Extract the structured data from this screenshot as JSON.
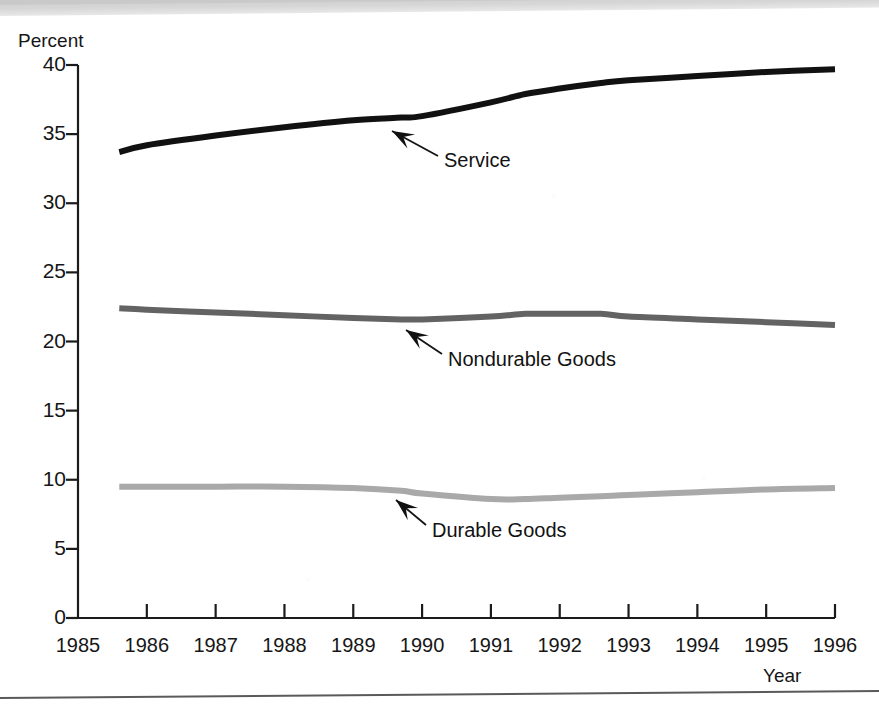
{
  "figure": {
    "kind": "scanned-line-chart",
    "y_axis_title": "Percent",
    "x_axis_title": "Year"
  },
  "chart_data": {
    "type": "line",
    "title": "",
    "subtitle": "",
    "xlabel": "Year",
    "ylabel": "Percent",
    "xlim": [
      1985,
      1996
    ],
    "ylim": [
      0,
      40
    ],
    "grid": false,
    "legend": "inline-annotations",
    "x": [
      1985.6,
      1986,
      1987,
      1988,
      1989,
      1989.7,
      1990,
      1991,
      1991.5,
      1992,
      1992.6,
      1993,
      1994,
      1995,
      1996
    ],
    "xticks": [
      "1985",
      "1986",
      "1987",
      "1988",
      "1989",
      "1990",
      "1991",
      "1992",
      "1993",
      "1994",
      "1995",
      "1996"
    ],
    "yticks": [
      "0",
      "5",
      "10",
      "15",
      "20",
      "25",
      "30",
      "35",
      "40"
    ],
    "series": [
      {
        "name": "Service",
        "color": "#111111",
        "linewidth": 6,
        "values": [
          33.7,
          34.2,
          34.9,
          35.5,
          36.0,
          36.2,
          36.3,
          37.3,
          37.9,
          38.3,
          38.7,
          38.9,
          39.2,
          39.5,
          39.7
        ],
        "annotation": {
          "label": "Service",
          "label_x": 444,
          "label_y": 149,
          "arrow_from_x": 438,
          "arrow_from_y": 156,
          "arrow_to_x": 392,
          "arrow_to_y": 131
        }
      },
      {
        "name": "Nondurable Goods",
        "color": "#636363",
        "linewidth": 6,
        "values": [
          22.4,
          22.3,
          22.1,
          21.9,
          21.7,
          21.6,
          21.6,
          21.8,
          22.0,
          22.0,
          22.0,
          21.8,
          21.6,
          21.4,
          21.2
        ],
        "annotation": {
          "label": "Nondurable Goods",
          "label_x": 448,
          "label_y": 348,
          "arrow_from_x": 442,
          "arrow_from_y": 354,
          "arrow_to_x": 406,
          "arrow_to_y": 330
        }
      },
      {
        "name": "Durable Goods",
        "color": "#a9a9a9",
        "linewidth": 6,
        "values": [
          9.5,
          9.5,
          9.5,
          9.5,
          9.4,
          9.2,
          9.0,
          8.6,
          8.6,
          8.7,
          8.8,
          8.9,
          9.1,
          9.3,
          9.4
        ],
        "annotation": {
          "label": "Durable Goods",
          "label_x": 432,
          "label_y": 519,
          "arrow_from_x": 426,
          "arrow_from_y": 525,
          "arrow_to_x": 396,
          "arrow_to_y": 500
        }
      }
    ]
  },
  "geometry": {
    "plot_left": 78,
    "plot_right": 835,
    "plot_top": 65,
    "plot_bottom": 618,
    "year_first": 1985,
    "year_last": 1996
  }
}
